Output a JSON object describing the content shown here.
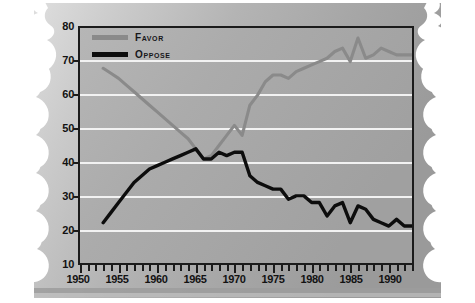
{
  "legend": {
    "position": "top-left",
    "entries": [
      {
        "label": "Favor",
        "color": "#8a8a8a",
        "name": "favor"
      },
      {
        "label": "Oppose",
        "color": "#0d0d0d",
        "name": "oppose"
      }
    ]
  },
  "axes": {
    "y_ticklabels": [
      "80",
      "70",
      "60",
      "50",
      "40",
      "30",
      "20",
      "10"
    ],
    "x_ticklabels": [
      "1950",
      "1955",
      "1960",
      "1965",
      "1970",
      "1975",
      "1980",
      "1985",
      "1990"
    ]
  },
  "colors": {
    "favor_line": "#8a8a8a",
    "oppose_line": "#0d0d0d",
    "plot_background": "#a8a8a8",
    "gridline": "#f2f2f2",
    "frame": "#1b1b1b",
    "paper_light": "#d8d8d8",
    "paper_dark": "#9a9a9a"
  },
  "chart_data": {
    "type": "line",
    "title": "",
    "subtitle": "",
    "xlabel": "",
    "ylabel": "",
    "xlim": [
      1950,
      1993
    ],
    "ylim": [
      10,
      80
    ],
    "ytick_step": 10,
    "xtick_step": 1,
    "xlabel_step": 5,
    "grid": true,
    "legend_position": "top-left",
    "series": [
      {
        "name": "Favor",
        "color": "#8a8a8a",
        "x": [
          1953,
          1954,
          1955,
          1956,
          1957,
          1958,
          1959,
          1960,
          1961,
          1962,
          1963,
          1964,
          1965,
          1966,
          1967,
          1968,
          1969,
          1970,
          1971,
          1972,
          1973,
          1974,
          1975,
          1976,
          1977,
          1978,
          1979,
          1980,
          1981,
          1982,
          1983,
          1984,
          1985,
          1986,
          1987,
          1988,
          1989,
          1990,
          1991,
          1992,
          1993
        ],
        "values": [
          68,
          66.5,
          65,
          63,
          61,
          59,
          57,
          55,
          53,
          51,
          49,
          47,
          44,
          41,
          42,
          45,
          48,
          51,
          48,
          57,
          60,
          64,
          66,
          66,
          65,
          67,
          68,
          69,
          70,
          71,
          73,
          74,
          70,
          77,
          71,
          72,
          74,
          73,
          72,
          72,
          72
        ]
      },
      {
        "name": "Oppose",
        "color": "#0d0d0d",
        "x": [
          1953,
          1954,
          1955,
          1956,
          1957,
          1958,
          1959,
          1960,
          1961,
          1962,
          1963,
          1964,
          1965,
          1966,
          1967,
          1968,
          1969,
          1970,
          1971,
          1972,
          1973,
          1974,
          1975,
          1976,
          1977,
          1978,
          1979,
          1980,
          1981,
          1982,
          1983,
          1984,
          1985,
          1986,
          1987,
          1988,
          1989,
          1990,
          1991,
          1992,
          1993
        ],
        "values": [
          22,
          25,
          28,
          31,
          34,
          36,
          38,
          39,
          40,
          41,
          42,
          43,
          44,
          41,
          41,
          43,
          42,
          43,
          43,
          36,
          34,
          33,
          32,
          32,
          29,
          30,
          30,
          28,
          28,
          24,
          27,
          28,
          22,
          27,
          26,
          23,
          22,
          21,
          23,
          21,
          21
        ]
      }
    ]
  }
}
